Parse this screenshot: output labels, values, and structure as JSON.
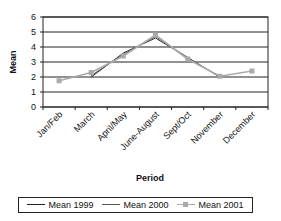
{
  "chart_data": {
    "type": "line",
    "title": "",
    "xlabel": "Period",
    "ylabel": "Mean",
    "ylim": [
      0,
      6
    ],
    "yticks": [
      0,
      1,
      2,
      3,
      4,
      5,
      6
    ],
    "grid": true,
    "legend_position": "bottom",
    "categories": [
      "Jan/Feb",
      "March",
      "April/May",
      "June-August",
      "Sept/Oct",
      "November",
      "December"
    ],
    "series": [
      {
        "name": "Mean 1999",
        "color": "#222222",
        "marker": "none",
        "values": [
          null,
          2.0,
          3.6,
          4.6,
          3.3,
          2.0,
          null
        ]
      },
      {
        "name": "Mean 2000",
        "color": "#555555",
        "marker": "none",
        "values": [
          null,
          2.1,
          3.5,
          4.7,
          3.3,
          2.0,
          null
        ]
      },
      {
        "name": "Mean 2001",
        "color": "#aaaaaa",
        "marker": "square",
        "values": [
          1.75,
          2.3,
          3.4,
          4.8,
          3.2,
          2.05,
          2.4
        ]
      }
    ]
  },
  "legend": {
    "items": [
      {
        "label": "Mean 1999",
        "color": "#222222",
        "marker": false
      },
      {
        "label": "Mean 2000",
        "color": "#555555",
        "marker": false
      },
      {
        "label": "Mean 2001",
        "color": "#aaaaaa",
        "marker": true
      }
    ]
  }
}
